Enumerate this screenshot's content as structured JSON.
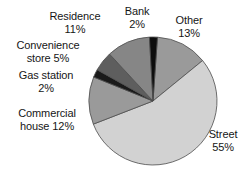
{
  "chart_data": {
    "type": "pie",
    "title": "",
    "categories": [
      "Other",
      "Street",
      "Commercial house",
      "Gas station",
      "Convenience store",
      "Residence",
      "Bank"
    ],
    "values": [
      13,
      55,
      12,
      2,
      5,
      11,
      2
    ],
    "value_unit": "%",
    "labels": [
      {
        "name": "Other",
        "pct": "13%",
        "line1": "Other",
        "line2": "13%",
        "color": "#9a9a9a"
      },
      {
        "name": "Street",
        "pct": "55%",
        "line1": "Street",
        "line2": "55%",
        "color": "#d2d2d2"
      },
      {
        "name": "Commercial house",
        "pct": "12%",
        "line1": "Commercial",
        "line2": "house 12%",
        "color": "#9a9a9a"
      },
      {
        "name": "Gas station",
        "pct": "2%",
        "line1": "Gas station",
        "line2": "2%",
        "color": "#1a1a1a"
      },
      {
        "name": "Convenience store",
        "pct": "5%",
        "line1": "Convenience",
        "line2": "store 5%",
        "color": "#5e5e5e"
      },
      {
        "name": "Residence",
        "pct": "11%",
        "line1": "Residence",
        "line2": "11%",
        "color": "#868686"
      },
      {
        "name": "Bank",
        "pct": "2%",
        "line1": "Bank",
        "line2": "2%",
        "color": "#0d0d0d"
      }
    ],
    "legend_position": "callout-labels",
    "grid": false,
    "xlabel": "",
    "ylabel": "",
    "colors": {
      "street": "#d2d2d2",
      "other": "#9a9a9a",
      "commercial_house": "#9a9a9a",
      "residence": "#868686",
      "convenience_store": "#5e5e5e",
      "gas_station": "#1a1a1a",
      "bank": "#0d0d0d",
      "outline": "#4d4d4d",
      "text": "#161616",
      "background": "#ffffff"
    },
    "geometry": {
      "center_x": 153,
      "center_y": 101,
      "radius": 64,
      "start_angle_deg": -86
    }
  }
}
